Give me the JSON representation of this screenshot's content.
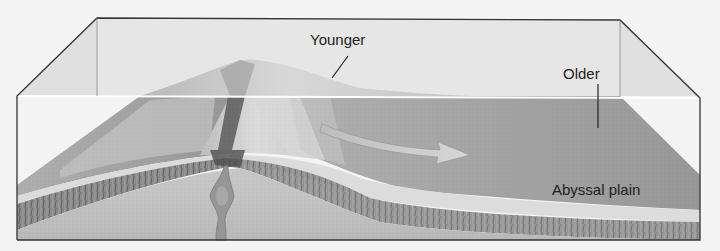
{
  "diagram": {
    "labels": {
      "younger": "Younger",
      "older": "Older",
      "abyssal_plain": "Abyssal plain"
    },
    "elements": [
      "transparent water box (ocean)",
      "mid-ocean ridge with central rift valley",
      "magma plume rising beneath rift",
      "spreading direction arrow pointing away from ridge",
      "abyssal plain seafloor",
      "crust / sediment layers"
    ],
    "colors": {
      "background": "#f4f4f4",
      "box_outline": "#333333",
      "water_above": "#e4e4e4",
      "water_surface": "#ffffff",
      "seafloor": "#9a9a9a",
      "ridge_light": "#d2d2d2",
      "rift_dark": "#4a4a4a",
      "mantle": "#bdbdbd",
      "magma": "#8e8e8e",
      "arrow": "#c8c8c8",
      "sediment_band": "#d8d8d8"
    }
  }
}
